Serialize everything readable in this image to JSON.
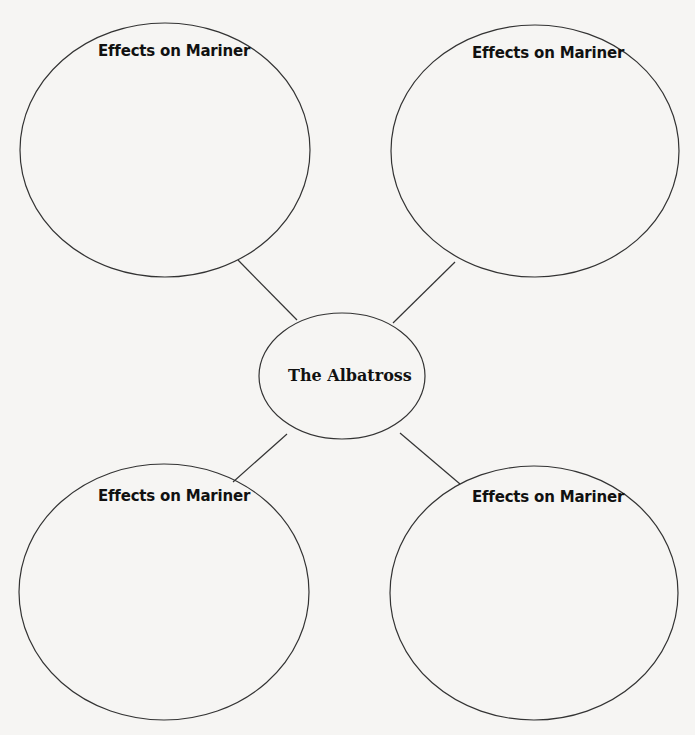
{
  "diagram": {
    "type": "web-organizer",
    "background": "#f6f5f3",
    "stroke_color": "#333333",
    "center": {
      "label": "The Albatross",
      "cx": 342,
      "cy": 376,
      "rx": 83,
      "ry": 63
    },
    "nodes": [
      {
        "id": "top-left",
        "label": "Effects on Mariner",
        "cx": 165,
        "cy": 150,
        "rx": 145,
        "ry": 127
      },
      {
        "id": "top-right",
        "label": "Effects on Mariner",
        "cx": 535,
        "cy": 151,
        "rx": 144,
        "ry": 126
      },
      {
        "id": "bottom-left",
        "label": "Effects on Mariner",
        "cx": 164,
        "cy": 592,
        "rx": 145,
        "ry": 128
      },
      {
        "id": "bottom-right",
        "label": "Effects on Mariner",
        "cx": 534,
        "cy": 593,
        "rx": 144,
        "ry": 127
      }
    ],
    "connectors": [
      {
        "from": "top-left",
        "x1": 238,
        "y1": 260,
        "x2": 297,
        "y2": 320
      },
      {
        "from": "top-right",
        "x1": 455,
        "y1": 262,
        "x2": 393,
        "y2": 323
      },
      {
        "from": "bottom-left",
        "x1": 287,
        "y1": 434,
        "x2": 233,
        "y2": 482
      },
      {
        "from": "bottom-right",
        "x1": 400,
        "y1": 433,
        "x2": 460,
        "y2": 484
      }
    ]
  }
}
